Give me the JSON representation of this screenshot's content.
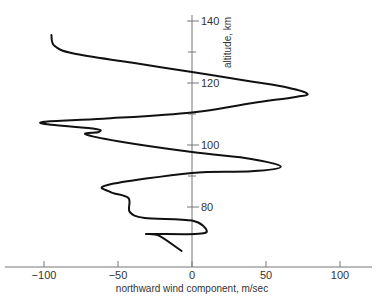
{
  "chart_data": {
    "type": "line",
    "title": "",
    "xlabel": "northward wind component, m/sec",
    "ylabel": "altitude, km",
    "xlim": [
      -125,
      125
    ],
    "ylim": [
      66,
      143
    ],
    "grid": false,
    "legend": null,
    "x_ticks": [
      -100,
      -50,
      0,
      50,
      100
    ],
    "x_tick_labels": [
      "−100",
      "−50",
      "0",
      "50",
      "100"
    ],
    "y_ticks": [
      80,
      100,
      120,
      140
    ],
    "y_tick_labels": [
      "80",
      "100",
      "120",
      "140"
    ],
    "y_minor_ticks": [
      90,
      110,
      130
    ],
    "series": [
      {
        "name": "northward wind profile",
        "points": [
          {
            "wind": -95,
            "alt": 135.5
          },
          {
            "wind": -93,
            "alt": 132
          },
          {
            "wind": -80,
            "alt": 129.5
          },
          {
            "wind": -40,
            "alt": 126.5
          },
          {
            "wind": 0,
            "alt": 123.5
          },
          {
            "wind": 40,
            "alt": 120.5
          },
          {
            "wind": 65,
            "alt": 118.5
          },
          {
            "wind": 78,
            "alt": 116.5
          },
          {
            "wind": 70,
            "alt": 115.5
          },
          {
            "wind": 40,
            "alt": 113.5
          },
          {
            "wind": 0,
            "alt": 110.5
          },
          {
            "wind": -60,
            "alt": 108.5
          },
          {
            "wind": -100,
            "alt": 107.5
          },
          {
            "wind": -95,
            "alt": 106.5
          },
          {
            "wind": -65,
            "alt": 105.2
          },
          {
            "wind": -63,
            "alt": 104.2
          },
          {
            "wind": -72,
            "alt": 103.5
          },
          {
            "wind": -50,
            "alt": 101.2
          },
          {
            "wind": 0,
            "alt": 97.7
          },
          {
            "wind": 40,
            "alt": 95.5
          },
          {
            "wind": 60,
            "alt": 93
          },
          {
            "wind": 40,
            "alt": 91.5
          },
          {
            "wind": 0,
            "alt": 91
          },
          {
            "wind": -57,
            "alt": 87.1
          },
          {
            "wind": -55,
            "alt": 84.8
          },
          {
            "wind": -43,
            "alt": 82.9
          },
          {
            "wind": -42,
            "alt": 78.4
          },
          {
            "wind": -32,
            "alt": 76.5
          },
          {
            "wind": 0,
            "alt": 75.6
          },
          {
            "wind": 10,
            "alt": 72.3
          },
          {
            "wind": 2,
            "alt": 71.3
          },
          {
            "wind": -30,
            "alt": 71.3
          },
          {
            "wind": -22,
            "alt": 70.7
          },
          {
            "wind": -7,
            "alt": 65.8
          }
        ]
      }
    ]
  },
  "axes": {
    "x_title": "northward wind component, m/sec",
    "y_title": "altitude, km",
    "x_labels": [
      "−100",
      "−50",
      "0",
      "50",
      "100"
    ],
    "y_labels": [
      "140",
      "120",
      "100",
      "80"
    ]
  },
  "colors": {
    "curve": "#111111",
    "axis": "#555555",
    "text": "#333333",
    "background": "#ffffff"
  }
}
